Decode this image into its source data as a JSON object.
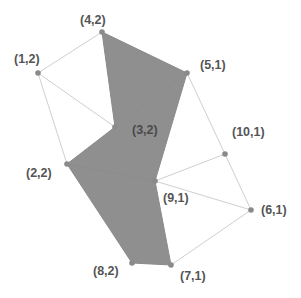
{
  "colors": {
    "background": "#ffffff",
    "region_fill": "#8f8f8f",
    "edge": "#cfcfcf",
    "node": "#8a8a8a",
    "label": "#555555"
  },
  "nodes": [
    {
      "id": "4,2",
      "label": "(4,2)",
      "x": 102,
      "y": 32,
      "lx": 80,
      "ly": 24
    },
    {
      "id": "1,2",
      "label": "(1,2)",
      "x": 38,
      "y": 73,
      "lx": 14,
      "ly": 63
    },
    {
      "id": "5,1",
      "label": "(5,1)",
      "x": 187,
      "y": 73,
      "lx": 200,
      "ly": 69
    },
    {
      "id": "3,2",
      "label": "(3,2)",
      "x": 115,
      "y": 127,
      "lx": 132,
      "ly": 134
    },
    {
      "id": "2,2",
      "label": "(2,2)",
      "x": 67,
      "y": 164,
      "lx": 26,
      "ly": 177
    },
    {
      "id": "10,1",
      "label": "(10,1)",
      "x": 225,
      "y": 154,
      "lx": 232,
      "ly": 136
    },
    {
      "id": "9,1",
      "label": "(9,1)",
      "x": 155,
      "y": 181,
      "lx": 163,
      "ly": 202
    },
    {
      "id": "6,1",
      "label": "(6,1)",
      "x": 251,
      "y": 210,
      "lx": 261,
      "ly": 214
    },
    {
      "id": "8,2",
      "label": "(8,2)",
      "x": 132,
      "y": 263,
      "lx": 93,
      "ly": 275
    },
    {
      "id": "7,1",
      "label": "(7,1)",
      "x": 171,
      "y": 265,
      "lx": 180,
      "ly": 280
    }
  ],
  "shaded_region": [
    "4,2",
    "5,1",
    "9,1",
    "7,1",
    "8,2",
    "2,2",
    "3,2"
  ],
  "edges": [
    [
      "1,2",
      "4,2"
    ],
    [
      "1,2",
      "3,2"
    ],
    [
      "1,2",
      "2,2"
    ],
    [
      "5,1",
      "10,1"
    ],
    [
      "10,1",
      "9,1"
    ],
    [
      "10,1",
      "6,1"
    ],
    [
      "9,1",
      "6,1"
    ],
    [
      "6,1",
      "7,1"
    ]
  ],
  "inner_edges": [
    [
      "3,2",
      "5,1"
    ],
    [
      "2,2",
      "9,1"
    ]
  ]
}
